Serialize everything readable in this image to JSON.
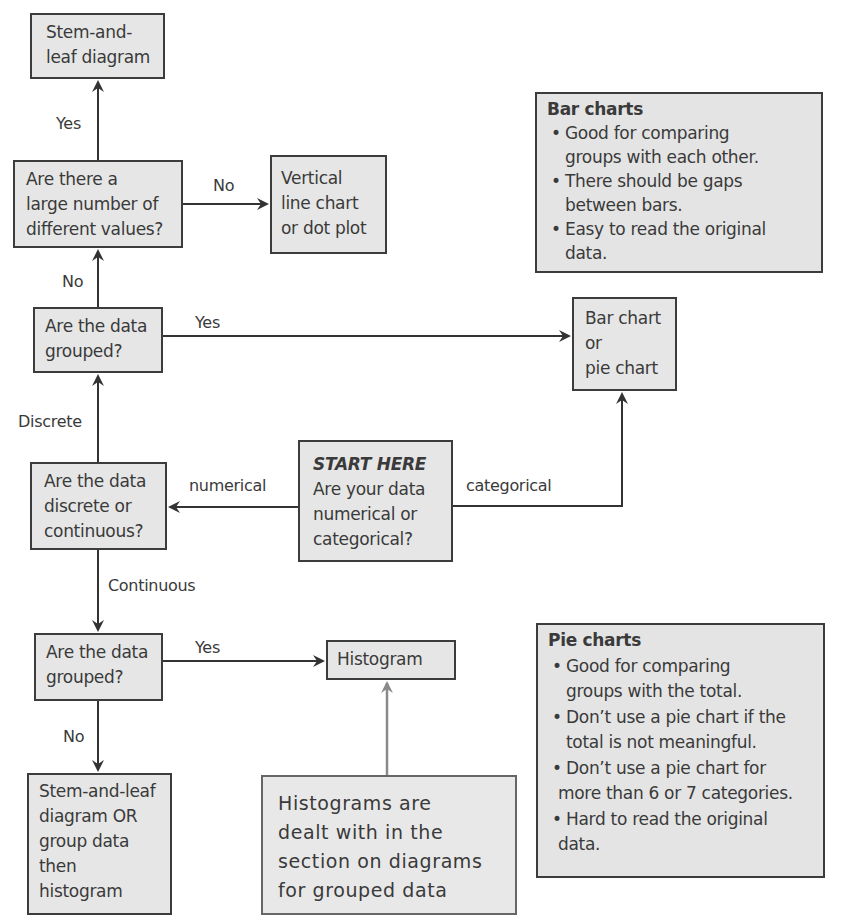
{
  "boxes": {
    "stem_leaf_top": {
      "lines": [
        "Stem-and-",
        "leaf diagram"
      ]
    },
    "large_number": {
      "lines": [
        "Are there a",
        "large number of",
        "different values?"
      ]
    },
    "vertical_line": {
      "lines": [
        "Vertical",
        "line chart",
        "or dot plot"
      ]
    },
    "grouped_top": {
      "lines": [
        "Are the data",
        "grouped?"
      ]
    },
    "bar_pie": {
      "lines": [
        "Bar chart",
        "or",
        "pie chart"
      ]
    },
    "discrete_continuous": {
      "lines": [
        "Are the data",
        "discrete or",
        "continuous?"
      ]
    },
    "start": {
      "heading": "START HERE",
      "lines": [
        "Are your data",
        "numerical or",
        "categorical?"
      ]
    },
    "grouped_bottom": {
      "lines": [
        "Are the data",
        "grouped?"
      ]
    },
    "histogram": {
      "lines": [
        "Histogram"
      ]
    },
    "stem_leaf_or_group": {
      "lines": [
        "Stem-and-leaf",
        "diagram OR",
        "group data",
        "then",
        "histogram"
      ]
    },
    "histograms_note": {
      "lines": [
        "Histograms are",
        "dealt with in the",
        "section on diagrams",
        "for grouped data"
      ]
    }
  },
  "edge_labels": {
    "yes_to_stem_leaf": "Yes",
    "no_to_vertical": "No",
    "no_to_large_number": "No",
    "yes_to_bar_pie": "Yes",
    "discrete": "Discrete",
    "numerical": "numerical",
    "categorical": "categorical",
    "continuous": "Continuous",
    "yes_to_histogram": "Yes",
    "no_to_stem_leaf_or_group": "No"
  },
  "notes": {
    "bar_charts": {
      "title": "Bar charts",
      "bullets": [
        [
          "Good for comparing",
          "groups with each other."
        ],
        [
          "There should be gaps",
          "between bars."
        ],
        [
          "Easy to read the original",
          "data."
        ]
      ]
    },
    "pie_charts": {
      "title": "Pie charts",
      "bullets": [
        [
          "Good for comparing",
          "groups with the total."
        ],
        [
          "Don’t use a pie chart if the",
          "total is not meaningful."
        ],
        [
          "Don’t use a pie chart for",
          "more than 6 or 7 categories."
        ],
        [
          "Hard to read the original",
          "data."
        ]
      ]
    }
  },
  "colors": {
    "box_fill": "#e6e6e6",
    "box_border": "#3c3c3c",
    "arrow": "#333333",
    "arrow_light": "#8a8a8a"
  }
}
